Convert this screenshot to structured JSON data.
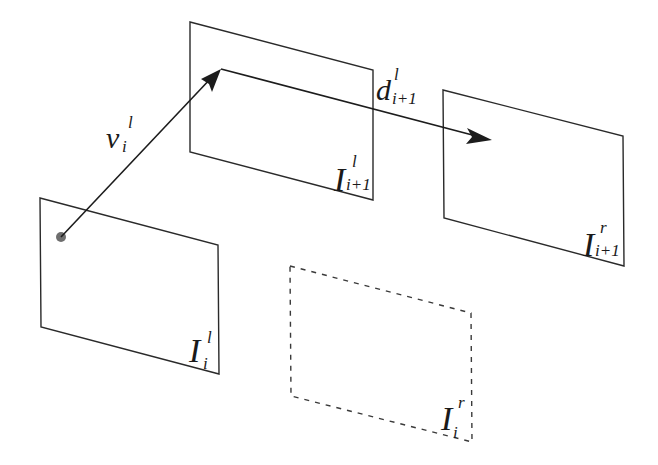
{
  "diagram": {
    "planes": {
      "I_i1_left": {
        "main": "I",
        "sup": "l",
        "sub": "i+1"
      },
      "I_i1_right": {
        "main": "I",
        "sup": "r",
        "sub": "i+1"
      },
      "I_i_left": {
        "main": "I",
        "sup": "l",
        "sub": "i"
      },
      "I_i_right": {
        "main": "I",
        "sup": "r",
        "sub": "i",
        "style": "dashed"
      }
    },
    "vectors": {
      "v": {
        "main": "v",
        "sup": "l",
        "sub": "i"
      },
      "d": {
        "main": "d",
        "sup": "l",
        "sub": "i+1"
      }
    },
    "colors": {
      "stroke": "#2a2a2a",
      "point": "#6e6e6e",
      "background": "#ffffff"
    }
  }
}
